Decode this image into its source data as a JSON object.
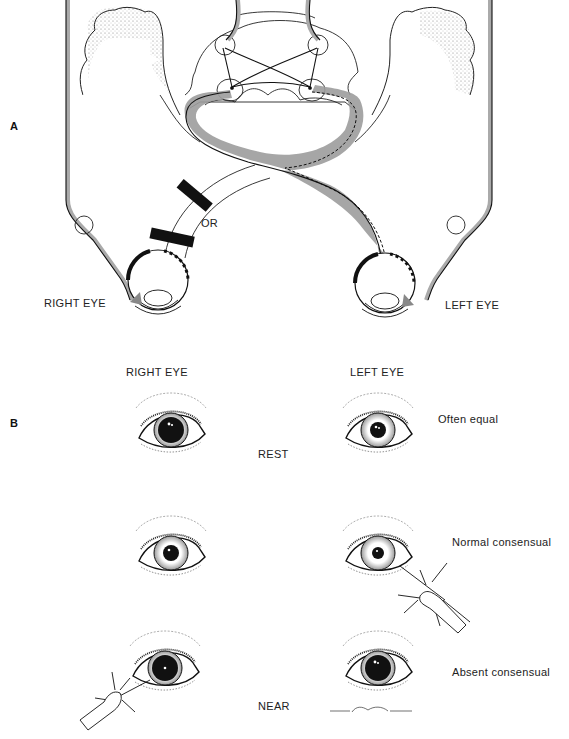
{
  "figure": {
    "panels": [
      {
        "id": "A",
        "letter": "A",
        "title": "Pupillary light reflex pathway",
        "labels": {
          "right_eye": "RIGHT EYE",
          "left_eye": "LEFT EYE",
          "or": "OR"
        },
        "structures": [
          "cerebral-cortex-left",
          "cerebral-cortex-right",
          "midbrain",
          "edinger-westphal-nuclei",
          "pretectal-nuclei",
          "optic-chiasm",
          "optic-nerve-right",
          "optic-nerve-left",
          "ciliary-ganglion-right",
          "ciliary-ganglion-left",
          "oculomotor-nerve-right",
          "oculomotor-nerve-left",
          "lesion-bar-upper",
          "lesion-bar-lower"
        ]
      },
      {
        "id": "B",
        "letter": "B",
        "column_headers": {
          "right": "RIGHT EYE",
          "left": "LEFT EYE"
        },
        "rows": [
          {
            "center_label": "REST",
            "side_label": "Often equal",
            "right_pupil": "dilated",
            "left_pupil": "normal",
            "light_on": "none"
          },
          {
            "center_label": "",
            "side_label": "Normal consensual",
            "right_pupil": "normal",
            "left_pupil": "constricted",
            "light_on": "left"
          },
          {
            "center_label": "NEAR",
            "side_label": "Absent consensual",
            "right_pupil": "dilated",
            "left_pupil": "dilated",
            "light_on": "right"
          }
        ],
        "signature": "Giddings"
      }
    ],
    "colors": {
      "line": "#111111",
      "pathway_shade": "#9a9a9a",
      "lesion": "#111111",
      "stipple": "#555555"
    }
  }
}
